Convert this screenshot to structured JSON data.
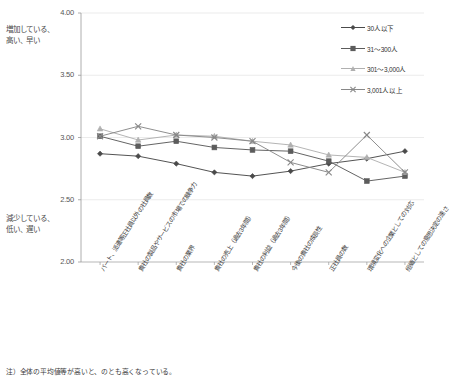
{
  "chart_data": {
    "type": "line",
    "title": "",
    "xlabel": "",
    "ylabel": "",
    "ylim": [
      2.0,
      4.0
    ],
    "ytick_labels": [
      "4.00",
      "3.50",
      "3.00",
      "2.50",
      "2.00"
    ],
    "ytick_values": [
      4.0,
      3.5,
      3.0,
      2.5,
      2.0
    ],
    "grid": true,
    "legend_position": "top-right",
    "categories": [
      "パート、派遣等正社員以外の社員数",
      "貴社の製品やサービスの市場での競争力",
      "貴社の業界",
      "貴社の売上（過去3年間）",
      "貴社の利益（過去3年間）",
      "今後の貴社の成長性",
      "正社員の数",
      "環境変化への企業としての対応",
      "組織としての意思決定の速さ"
    ],
    "series": [
      {
        "name": "30人以下",
        "marker": "diamond",
        "color": "#4a4a4a",
        "values": [
          2.87,
          2.85,
          2.79,
          2.72,
          2.69,
          2.73,
          2.79,
          2.83,
          2.89
        ]
      },
      {
        "name": "31～300人",
        "marker": "square",
        "color": "#5c5c5c",
        "values": [
          3.01,
          2.93,
          2.97,
          2.92,
          2.9,
          2.89,
          2.81,
          2.65,
          2.69
        ]
      },
      {
        "name": "301～3,000人",
        "marker": "triangle",
        "color": "#b0b0b0",
        "values": [
          3.07,
          2.98,
          3.02,
          3.01,
          2.97,
          2.94,
          2.86,
          2.84,
          2.72
        ]
      },
      {
        "name": "3,001人以上",
        "marker": "cross",
        "color": "#888888",
        "values": [
          3.01,
          3.09,
          3.02,
          3.0,
          2.97,
          2.8,
          2.72,
          3.02,
          2.72
        ]
      }
    ]
  },
  "annotations": {
    "high_label": "増加している、\n高い、早い",
    "low_label": "減少している、\n低い、遅い"
  },
  "footnote": "注）全体の平均値等が高いと、のとも高くなっている。",
  "colors": {
    "axis": "#9a9a9a",
    "grid": "#e3e3e3",
    "text": "#3a3a3a",
    "background": "#ffffff"
  }
}
